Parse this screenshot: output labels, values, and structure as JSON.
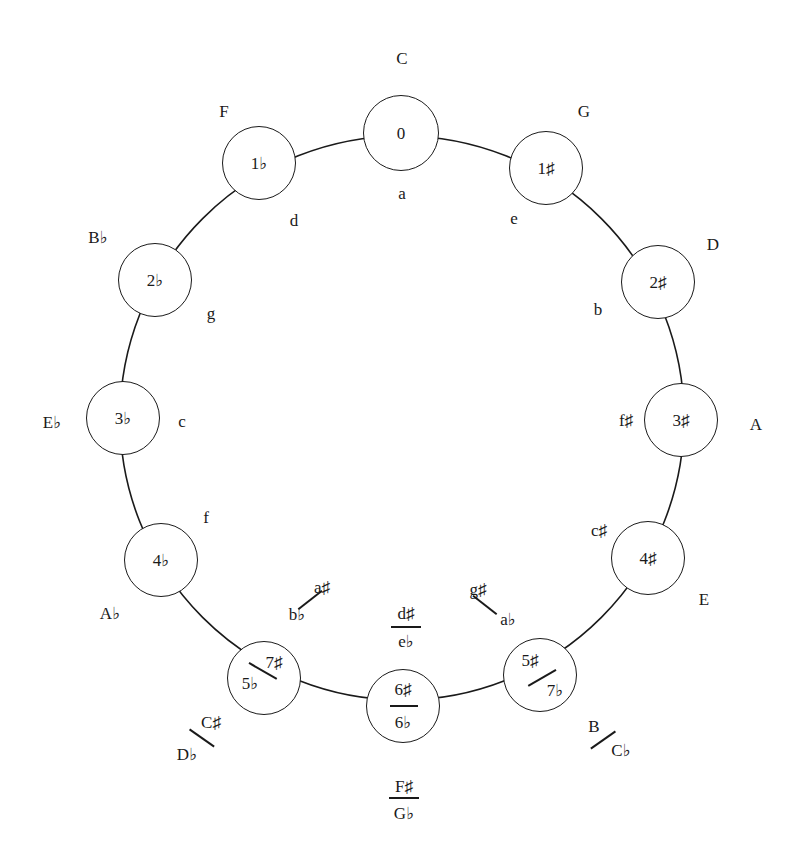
{
  "diagram": {
    "ring": {
      "cx": 402,
      "cy": 418,
      "r": 282,
      "stroke": "#1a1a1a"
    },
    "nodes": [
      {
        "id": "0",
        "cx": 401,
        "cy": 133,
        "r": 38,
        "label": "0",
        "major": "C",
        "minor": "a"
      },
      {
        "id": "1s",
        "cx": 546,
        "cy": 168,
        "r": 37,
        "label": "1♯",
        "major": "G",
        "minor": "e"
      },
      {
        "id": "2s",
        "cx": 658,
        "cy": 282,
        "r": 37,
        "label": "2♯",
        "major": "D",
        "minor": "b"
      },
      {
        "id": "3s",
        "cx": 681,
        "cy": 420,
        "r": 37,
        "label": "3♯",
        "major": "A",
        "minor": "f♯"
      },
      {
        "id": "4s",
        "cx": 648,
        "cy": 558,
        "r": 37,
        "label": "4♯",
        "major": "E",
        "minor": "c♯"
      },
      {
        "id": "5s7f",
        "cx": 540,
        "cy": 675,
        "r": 37,
        "label_top": "5♯",
        "label_bottom": "7♭",
        "major_top": "B",
        "major_bottom": "C♭",
        "minor_top": "g♯",
        "minor_bottom": "a♭"
      },
      {
        "id": "6s6f",
        "cx": 403,
        "cy": 706,
        "r": 37,
        "label_top": "6♯",
        "label_bottom": "6♭",
        "major_top": "F♯",
        "major_bottom": "G♭",
        "minor_top": "d♯",
        "minor_bottom": "e♭"
      },
      {
        "id": "7s5f",
        "cx": 264,
        "cy": 678,
        "r": 37,
        "label_top": "7♯",
        "label_bottom": "5♭",
        "major_top": "C♯",
        "major_bottom": "D♭",
        "minor_top": "a♯",
        "minor_bottom": "b♭"
      },
      {
        "id": "4f",
        "cx": 161,
        "cy": 560,
        "r": 37,
        "label": "4♭",
        "major": "A♭",
        "minor": "f"
      },
      {
        "id": "3f",
        "cx": 123,
        "cy": 418,
        "r": 37,
        "label": "3♭",
        "major": "E♭",
        "minor": "c"
      },
      {
        "id": "2f",
        "cx": 155,
        "cy": 280,
        "r": 37,
        "label": "2♭",
        "major": "B♭",
        "minor": "g"
      },
      {
        "id": "1f",
        "cx": 259,
        "cy": 163,
        "r": 37,
        "label": "1♭",
        "major": "F",
        "minor": "d"
      }
    ]
  },
  "labels": {
    "major": {
      "C": "C",
      "G": "G",
      "D": "D",
      "A": "A",
      "E": "E",
      "B": "B",
      "Cb": "C♭",
      "Fs": "F♯",
      "Gb": "G♭",
      "Cs": "C♯",
      "Db": "D♭",
      "Ab": "A♭",
      "Eb": "E♭",
      "Bb": "B♭",
      "F": "F"
    },
    "minor": {
      "a": "a",
      "e": "e",
      "b": "b",
      "fs": "f♯",
      "cs": "c♯",
      "gs": "g♯",
      "ab": "a♭",
      "ds": "d♯",
      "eb": "e♭",
      "as": "a♯",
      "bb": "b♭",
      "f": "f",
      "c": "c",
      "g": "g",
      "d": "d"
    },
    "inner": {
      "n0": "0",
      "n1s": "1♯",
      "n2s": "2♯",
      "n3s": "3♯",
      "n4s": "4♯",
      "n5s": "5♯",
      "n7f": "7♭",
      "n6s": "6♯",
      "n6f": "6♭",
      "n7s": "7♯",
      "n5f": "5♭",
      "n4f": "4♭",
      "n3f": "3♭",
      "n2f": "2♭",
      "n1f": "1♭"
    }
  }
}
